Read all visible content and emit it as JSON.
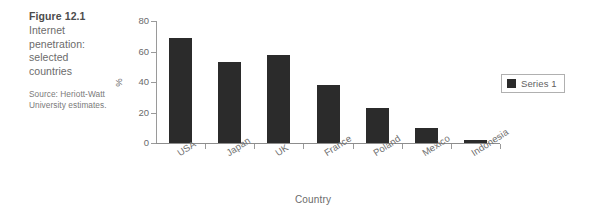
{
  "figure": {
    "number": "Figure 12.1",
    "title": "Internet penetration: selected countries",
    "source": "Source: Heriott-Watt University estimates."
  },
  "legend": {
    "position": "right",
    "swatch_color": "#2b2b2b",
    "label": "Series 1"
  },
  "axes": {
    "y_label": "%",
    "x_label": "Country",
    "y_ticks": [
      "0",
      "20",
      "40",
      "60",
      "80"
    ]
  },
  "chart_data": {
    "type": "bar",
    "title": "Internet penetration: selected countries",
    "xlabel": "Country",
    "ylabel": "%",
    "categories": [
      "USA",
      "Japan",
      "UK",
      "France",
      "Poland",
      "Mexico",
      "Indonesia"
    ],
    "series": [
      {
        "name": "Series 1",
        "color": "#2b2b2b",
        "values": [
          69,
          53,
          58,
          38,
          23,
          10,
          2
        ]
      }
    ],
    "ylim": [
      0,
      80
    ],
    "ytick_step": 20,
    "grid": false,
    "legend_position": "right",
    "bar_color": "#2b2b2b"
  }
}
